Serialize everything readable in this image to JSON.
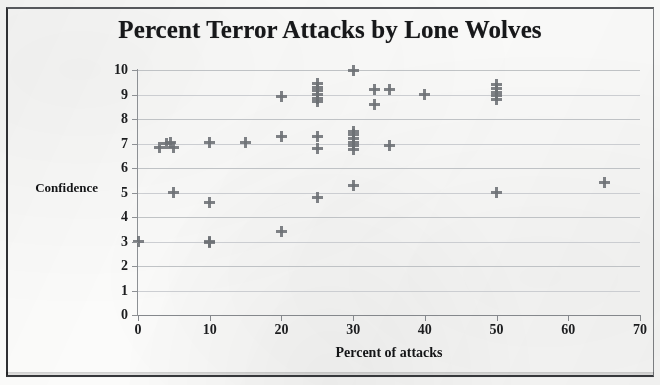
{
  "chart_data": {
    "type": "scatter",
    "title": "Percent Terror Attacks by Lone Wolves",
    "xlabel": "Percent of attacks",
    "ylabel": "Confidence",
    "xlim": [
      0,
      70
    ],
    "ylim": [
      0,
      10
    ],
    "xticks": [
      0,
      10,
      20,
      30,
      40,
      50,
      60,
      70
    ],
    "yticks": [
      0,
      1,
      2,
      3,
      4,
      5,
      6,
      7,
      8,
      9,
      10
    ],
    "grid": "horizontal",
    "legend": "none",
    "marker": "plus",
    "marker_color": "#6d7175",
    "points": [
      {
        "x": 0,
        "y": 3.0
      },
      {
        "x": 3,
        "y": 6.85
      },
      {
        "x": 4,
        "y": 7.0
      },
      {
        "x": 4.6,
        "y": 7.05
      },
      {
        "x": 5,
        "y": 6.85
      },
      {
        "x": 5,
        "y": 5.0
      },
      {
        "x": 10,
        "y": 7.05
      },
      {
        "x": 10,
        "y": 4.6
      },
      {
        "x": 10,
        "y": 3.0
      },
      {
        "x": 10,
        "y": 2.95
      },
      {
        "x": 15,
        "y": 7.05
      },
      {
        "x": 20,
        "y": 8.9
      },
      {
        "x": 20,
        "y": 7.3
      },
      {
        "x": 20,
        "y": 3.4
      },
      {
        "x": 25,
        "y": 9.45
      },
      {
        "x": 25,
        "y": 9.3
      },
      {
        "x": 25,
        "y": 9.15
      },
      {
        "x": 25,
        "y": 9.0
      },
      {
        "x": 25,
        "y": 8.85
      },
      {
        "x": 25,
        "y": 8.7
      },
      {
        "x": 25,
        "y": 7.3
      },
      {
        "x": 25,
        "y": 6.8
      },
      {
        "x": 25,
        "y": 4.8
      },
      {
        "x": 30,
        "y": 10.0
      },
      {
        "x": 30,
        "y": 7.5
      },
      {
        "x": 30,
        "y": 7.35
      },
      {
        "x": 30,
        "y": 7.2
      },
      {
        "x": 30,
        "y": 7.05
      },
      {
        "x": 30,
        "y": 6.9
      },
      {
        "x": 30,
        "y": 6.75
      },
      {
        "x": 30,
        "y": 5.3
      },
      {
        "x": 33,
        "y": 9.2
      },
      {
        "x": 33,
        "y": 8.6
      },
      {
        "x": 35,
        "y": 9.2
      },
      {
        "x": 35,
        "y": 6.9
      },
      {
        "x": 40,
        "y": 9.0
      },
      {
        "x": 50,
        "y": 9.4
      },
      {
        "x": 50,
        "y": 9.25
      },
      {
        "x": 50,
        "y": 9.1
      },
      {
        "x": 50,
        "y": 8.95
      },
      {
        "x": 50,
        "y": 8.8
      },
      {
        "x": 50,
        "y": 5.0
      },
      {
        "x": 65,
        "y": 5.4
      }
    ]
  },
  "colors": {
    "marker": "#6d7175",
    "grid": "#b9bcc0",
    "axis": "#8d9094",
    "text": "#17181a",
    "page": "#fbfbfa"
  }
}
